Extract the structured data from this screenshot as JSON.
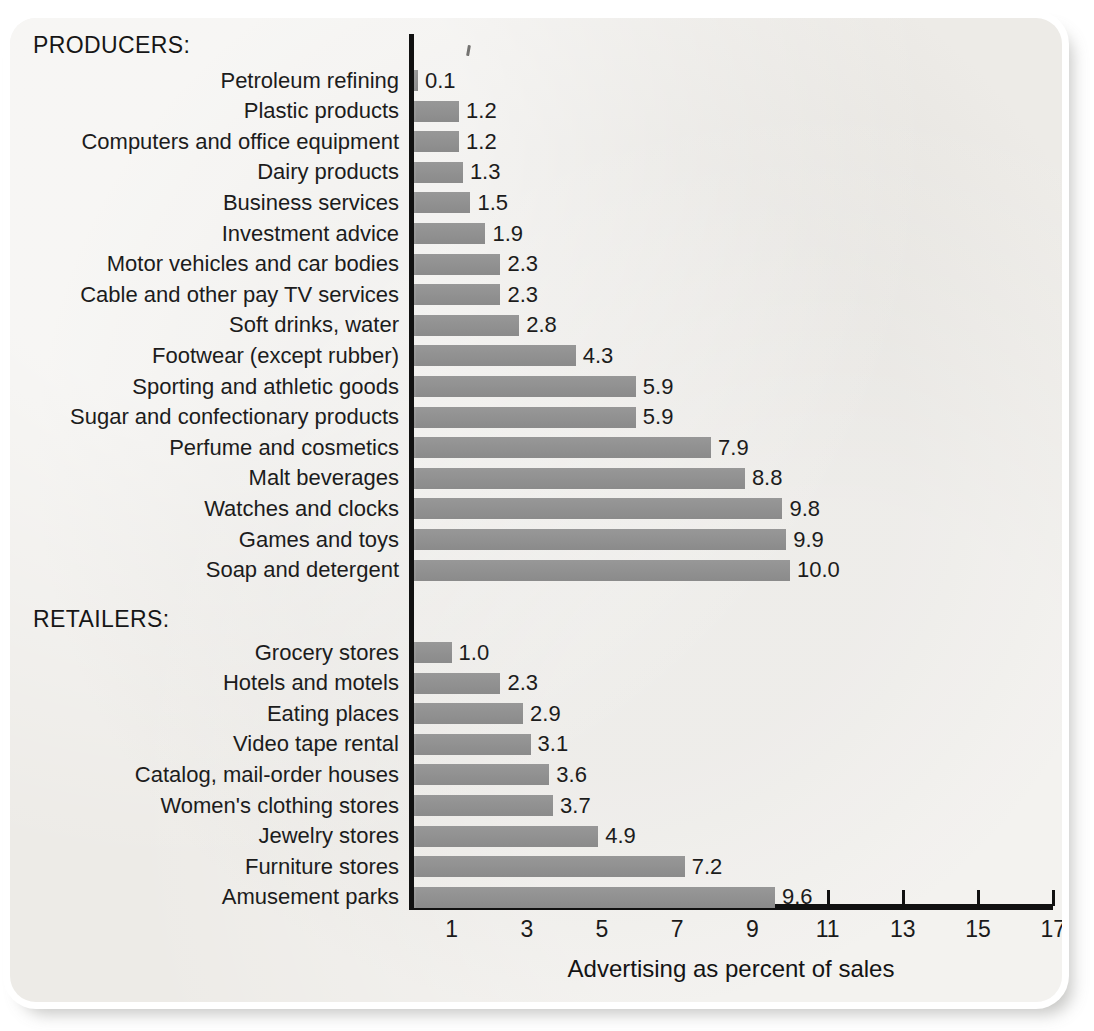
{
  "card": {
    "background_color": "#edebe7",
    "bar_color": "#929292",
    "axis_color": "#111111"
  },
  "groups": [
    {
      "heading": "PRODUCERS:"
    },
    {
      "heading": "RETAILERS:"
    }
  ],
  "axis": {
    "title": "Advertising as percent of sales",
    "ticks": [
      "1",
      "3",
      "5",
      "7",
      "9",
      "11",
      "13",
      "15",
      "17"
    ],
    "min": 0,
    "max": 17
  },
  "chart_data": {
    "type": "bar",
    "orientation": "horizontal",
    "title": "",
    "xlabel": "Advertising as percent of sales",
    "ylabel": "",
    "xlim": [
      0,
      17
    ],
    "xticks": [
      1,
      3,
      5,
      7,
      9,
      11,
      13,
      15,
      17
    ],
    "grid": false,
    "legend": false,
    "value_labels": true,
    "groups": [
      {
        "name": "PRODUCERS:",
        "categories": [
          "Petroleum refining",
          "Plastic products",
          "Computers and office equipment",
          "Dairy products",
          "Business services",
          "Investment advice",
          "Motor vehicles and car bodies",
          "Cable and other pay TV services",
          "Soft drinks, water",
          "Footwear (except rubber)",
          "Sporting and athletic goods",
          "Sugar and confectionary products",
          "Perfume and cosmetics",
          "Malt beverages",
          "Watches and clocks",
          "Games and toys",
          "Soap and detergent"
        ],
        "values": [
          0.1,
          1.2,
          1.2,
          1.3,
          1.5,
          1.9,
          2.3,
          2.3,
          2.8,
          4.3,
          5.9,
          5.9,
          7.9,
          8.8,
          9.8,
          9.9,
          10.0
        ],
        "value_labels": [
          "0.1",
          "1.2",
          "1.2",
          "1.3",
          "1.5",
          "1.9",
          "2.3",
          "2.3",
          "2.8",
          "4.3",
          "5.9",
          "5.9",
          "7.9",
          "8.8",
          "9.8",
          "9.9",
          "10.0"
        ]
      },
      {
        "name": "RETAILERS:",
        "categories": [
          "Grocery stores",
          "Hotels and motels",
          "Eating places",
          "Video tape rental",
          "Catalog, mail-order houses",
          "Women's clothing stores",
          "Jewelry stores",
          "Furniture stores",
          "Amusement parks"
        ],
        "values": [
          1.0,
          2.3,
          2.9,
          3.1,
          3.6,
          3.7,
          4.9,
          7.2,
          9.6
        ],
        "value_labels": [
          "1.0",
          "2.3",
          "2.9",
          "3.1",
          "3.6",
          "3.7",
          "4.9",
          "7.2",
          "9.6"
        ]
      }
    ]
  }
}
